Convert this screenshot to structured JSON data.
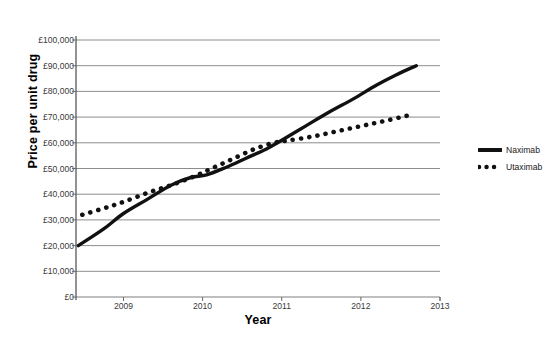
{
  "chart_data": {
    "type": "line",
    "title": "",
    "xlabel": "Year",
    "ylabel": "Price per unit drug",
    "xlim": [
      2008.4,
      2013.0
    ],
    "ylim": [
      0,
      100000
    ],
    "grid": true,
    "legend_position": "right",
    "x_tick_labels": [
      "2009",
      "2010",
      "2011",
      "2012",
      "2013"
    ],
    "x_ticks": [
      2009,
      2010,
      2011,
      2012,
      2013
    ],
    "y_tick_labels": [
      "£100,000",
      "£90,000",
      "£80,000",
      "£70,000",
      "£60,000",
      "£50,000",
      "£40,000",
      "£30,000",
      "£20,000",
      "£10,000",
      "£0"
    ],
    "y_ticks": [
      100000,
      90000,
      80000,
      70000,
      60000,
      50000,
      40000,
      30000,
      20000,
      10000,
      0
    ],
    "currency_symbol": "£",
    "series": [
      {
        "name": "Naximab",
        "style": "solid",
        "color": "#111111",
        "x": [
          2008.43,
          2008.75,
          2009.0,
          2009.3,
          2009.6,
          2009.85,
          2010.05,
          2010.3,
          2010.55,
          2010.8,
          2011.0,
          2011.3,
          2011.6,
          2011.9,
          2012.2,
          2012.45,
          2012.7
        ],
        "values": [
          20000,
          26500,
          32500,
          38000,
          43500,
          46500,
          47500,
          50500,
          54000,
          57500,
          61000,
          66500,
          72000,
          77000,
          82500,
          86500,
          90000
        ]
      },
      {
        "name": "Utaximab",
        "style": "dotted",
        "color": "#111111",
        "x": [
          2008.48,
          2008.75,
          2009.0,
          2009.3,
          2009.6,
          2009.9,
          2010.15,
          2010.4,
          2010.65,
          2010.9,
          2011.1,
          2011.4,
          2011.7,
          2012.0,
          2012.3,
          2012.65
        ],
        "values": [
          32000,
          34500,
          37000,
          40500,
          43500,
          47000,
          50500,
          54000,
          57500,
          60000,
          61000,
          62500,
          64500,
          66500,
          68500,
          71000
        ]
      }
    ]
  },
  "legend": {
    "items": [
      {
        "label": "Naximab",
        "style": "solid"
      },
      {
        "label": "Utaximab",
        "style": "dotted"
      }
    ]
  }
}
